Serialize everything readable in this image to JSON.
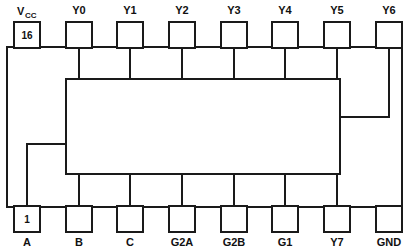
{
  "diagram": {
    "package": "DIP-16",
    "stroke_color": "#1a1a1a",
    "background_color": "#ffffff",
    "pin_count": 16
  },
  "pins": {
    "top": [
      {
        "label": "Vcc",
        "label_main": "V",
        "label_sub": "CC",
        "number": "16",
        "number_shown": true
      },
      {
        "label": "Y0",
        "number": "15",
        "number_shown": false
      },
      {
        "label": "Y1",
        "number": "14",
        "number_shown": false
      },
      {
        "label": "Y2",
        "number": "13",
        "number_shown": false
      },
      {
        "label": "Y3",
        "number": "12",
        "number_shown": false
      },
      {
        "label": "Y4",
        "number": "11",
        "number_shown": false
      },
      {
        "label": "Y5",
        "number": "10",
        "number_shown": false
      },
      {
        "label": "Y6",
        "number": "9",
        "number_shown": false
      }
    ],
    "bottom": [
      {
        "label": "A",
        "number": "1",
        "number_shown": true
      },
      {
        "label": "B",
        "number": "2",
        "number_shown": false
      },
      {
        "label": "C",
        "number": "3",
        "number_shown": false
      },
      {
        "label": "G2A",
        "number": "4",
        "number_shown": false
      },
      {
        "label": "G2B",
        "number": "5",
        "number_shown": false
      },
      {
        "label": "G1",
        "number": "6",
        "number_shown": false
      },
      {
        "label": "Y7",
        "number": "7",
        "number_shown": false
      },
      {
        "label": "GND",
        "number": "8",
        "number_shown": false
      }
    ]
  }
}
